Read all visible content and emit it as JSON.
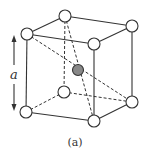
{
  "figure": {
    "dimension_label": "a",
    "caption": "(a)",
    "colors": {
      "line": "#333333",
      "corner_atom_fill": "#ffffff",
      "center_atom_fill": "#888888"
    },
    "corner_atoms": [
      {
        "name": "top-back-left",
        "x": 65,
        "y": 16
      },
      {
        "name": "top-back-right",
        "x": 132,
        "y": 26
      },
      {
        "name": "top-front-left",
        "x": 27,
        "y": 34
      },
      {
        "name": "top-front-right",
        "x": 94,
        "y": 44
      },
      {
        "name": "bottom-back-left",
        "x": 64,
        "y": 92
      },
      {
        "name": "bottom-back-right",
        "x": 132,
        "y": 102
      },
      {
        "name": "bottom-front-left",
        "x": 26,
        "y": 112
      },
      {
        "name": "bottom-front-right",
        "x": 94,
        "y": 121
      }
    ],
    "center_atom": {
      "x": 78,
      "y": 70
    }
  }
}
